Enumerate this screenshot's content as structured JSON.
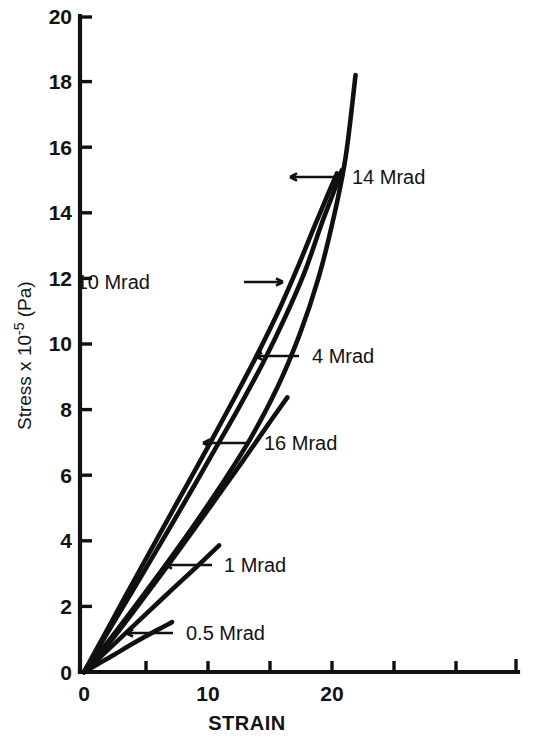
{
  "chart_data": {
    "type": "line",
    "title": "",
    "xlabel": "STRAIN",
    "ylabel": "Stress x 10-5  (Pa)",
    "ylabel_parts": {
      "prefix": "Stress x 10",
      "exponent": "-5",
      "suffix": " (Pa)"
    },
    "xlim": [
      0,
      35
    ],
    "ylim": [
      0,
      20
    ],
    "x_ticks": [
      0,
      5,
      10,
      15,
      20,
      25,
      30,
      35
    ],
    "x_tick_labels": [
      "0",
      "",
      "10",
      "",
      "20",
      "",
      "",
      ""
    ],
    "y_ticks": [
      0,
      2,
      4,
      6,
      8,
      10,
      12,
      14,
      16,
      18,
      20
    ],
    "y_tick_labels": [
      "0",
      "2",
      "4",
      "6",
      "8",
      "10",
      "12",
      "14",
      "16",
      "18",
      "20"
    ],
    "grid": false,
    "legend": "annotations-with-arrows",
    "series": [
      {
        "name": "0.5 Mrad",
        "label": "0.5 Mrad",
        "points": [
          [
            0,
            0
          ],
          [
            1.2,
            0.26
          ],
          [
            2.4,
            0.52
          ],
          [
            3.6,
            0.79
          ],
          [
            4.8,
            1.05
          ],
          [
            6.0,
            1.3
          ],
          [
            7.1,
            1.52
          ]
        ]
      },
      {
        "name": "1 Mrad",
        "label": "1 Mrad",
        "points": [
          [
            0,
            0
          ],
          [
            1.8,
            0.63
          ],
          [
            3.6,
            1.27
          ],
          [
            5.4,
            1.91
          ],
          [
            7.2,
            2.55
          ],
          [
            9.0,
            3.18
          ],
          [
            10.9,
            3.86
          ]
        ]
      },
      {
        "name": "16 Mrad",
        "label": "16 Mrad",
        "points": [
          [
            0,
            0
          ],
          [
            1.0,
            0.42
          ],
          [
            2.4,
            1.06
          ],
          [
            4.2,
            1.95
          ],
          [
            6.2,
            2.96
          ],
          [
            8.4,
            4.1
          ],
          [
            10.6,
            5.26
          ],
          [
            12.8,
            6.43
          ],
          [
            14.8,
            7.52
          ],
          [
            16.4,
            8.37
          ]
        ]
      },
      {
        "name": "4 Mrad",
        "label": "4 Mrad",
        "points": [
          [
            0,
            0
          ],
          [
            0.9,
            0.44
          ],
          [
            2.2,
            1.05
          ],
          [
            4.0,
            1.95
          ],
          [
            6.2,
            3.07
          ],
          [
            8.6,
            4.33
          ],
          [
            11.0,
            5.66
          ],
          [
            13.4,
            7.1
          ],
          [
            15.6,
            8.68
          ],
          [
            17.4,
            10.3
          ],
          [
            18.9,
            12.0
          ],
          [
            20.1,
            13.8
          ],
          [
            21.1,
            15.7
          ],
          [
            21.9,
            18.2
          ]
        ]
      },
      {
        "name": "10 Mrad",
        "label": "10 Mrad",
        "points": [
          [
            0,
            0
          ],
          [
            0.8,
            0.5
          ],
          [
            2.0,
            1.26
          ],
          [
            3.8,
            2.4
          ],
          [
            5.8,
            3.68
          ],
          [
            8.0,
            5.1
          ],
          [
            10.2,
            6.55
          ],
          [
            12.4,
            8.0
          ],
          [
            14.4,
            9.4
          ],
          [
            16.2,
            10.8
          ],
          [
            17.8,
            12.2
          ],
          [
            19.1,
            13.6
          ],
          [
            20.1,
            14.6
          ],
          [
            20.8,
            15.3
          ]
        ]
      },
      {
        "name": "14 Mrad",
        "label": "14 Mrad",
        "points": [
          [
            0,
            0
          ],
          [
            0.8,
            0.55
          ],
          [
            2.0,
            1.38
          ],
          [
            3.8,
            2.63
          ],
          [
            5.8,
            4.0
          ],
          [
            8.0,
            5.5
          ],
          [
            10.2,
            7.0
          ],
          [
            12.2,
            8.4
          ],
          [
            14.0,
            9.7
          ],
          [
            15.8,
            11.1
          ],
          [
            17.3,
            12.4
          ],
          [
            18.6,
            13.6
          ],
          [
            19.6,
            14.5
          ],
          [
            20.4,
            15.2
          ]
        ]
      }
    ],
    "annotations": [
      {
        "name": "annotation-14-mrad",
        "text": "14 Mrad",
        "arrow_direction": "left",
        "label_x": 352,
        "label_y": 184,
        "tip_x": 290,
        "tip_y": 177,
        "tail_x": 337,
        "tail_y": 177
      },
      {
        "name": "annotation-10-mrad",
        "text": "10 Mrad",
        "arrow_direction": "right",
        "label_x": 150,
        "label_y": 289,
        "tip_x": 283,
        "tip_y": 282,
        "tail_x": 244,
        "tail_y": 282
      },
      {
        "name": "annotation-4-mrad",
        "text": "4 Mrad",
        "arrow_direction": "left",
        "label_x": 312,
        "label_y": 363,
        "tip_x": 255,
        "tip_y": 356,
        "tail_x": 299,
        "tail_y": 356
      },
      {
        "name": "annotation-16-mrad",
        "text": "16 Mrad",
        "arrow_direction": "left",
        "label_x": 264,
        "label_y": 450,
        "tip_x": 203,
        "tip_y": 443,
        "tail_x": 250,
        "tail_y": 443
      },
      {
        "name": "annotation-1-mrad",
        "text": "1 Mrad",
        "arrow_direction": "left",
        "label_x": 224,
        "label_y": 572,
        "tip_x": 165,
        "tip_y": 565,
        "tail_x": 212,
        "tail_y": 565
      },
      {
        "name": "annotation-05-mrad",
        "text": "0.5 Mrad",
        "arrow_direction": "left",
        "label_x": 186,
        "label_y": 640,
        "tip_x": 126,
        "tip_y": 633,
        "tail_x": 173,
        "tail_y": 633
      }
    ]
  },
  "geometry": {
    "origin_x": 84,
    "origin_y": 672,
    "x_axis_end": 518,
    "y_axis_top": 16,
    "px_per_x": 12.4,
    "px_per_y": 32.8
  }
}
